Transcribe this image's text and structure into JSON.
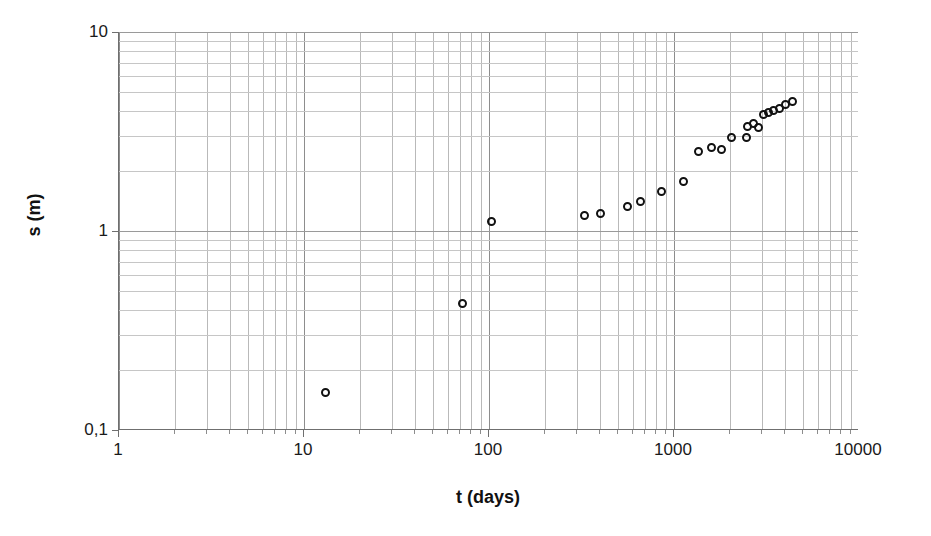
{
  "chart_data": {
    "type": "scatter",
    "title": "",
    "xlabel": "t (days)",
    "ylabel": "s (m)",
    "xscale": "log",
    "yscale": "log",
    "xlim": [
      1,
      10000
    ],
    "ylim": [
      0.1,
      10
    ],
    "grid": true,
    "legend": false,
    "marker": "open-circle",
    "marker_color": "#111111",
    "x_tick_labels": [
      "1",
      "10",
      "100",
      "1000",
      "10000"
    ],
    "x_tick_values": [
      1,
      10,
      100,
      1000,
      10000
    ],
    "y_tick_labels": [
      "0,1",
      "1",
      "10"
    ],
    "y_tick_values": [
      0.1,
      1,
      10
    ],
    "series": [
      {
        "name": "settlement",
        "x": [
          13,
          72,
          103,
          330,
          400,
          560,
          660,
          860,
          1130,
          1350,
          1600,
          1800,
          2050,
          2450,
          2500,
          2700,
          2850,
          3050,
          3250,
          3450,
          3700,
          4000,
          4350
        ],
        "y": [
          0.155,
          0.43,
          1.12,
          1.2,
          1.23,
          1.33,
          1.4,
          1.58,
          1.78,
          2.52,
          2.62,
          2.58,
          2.95,
          2.95,
          3.35,
          3.45,
          3.3,
          3.85,
          3.95,
          4.05,
          4.15,
          4.3,
          4.45
        ]
      }
    ]
  },
  "axes": {
    "x_title": "t (days)",
    "y_title": "s (m)"
  }
}
